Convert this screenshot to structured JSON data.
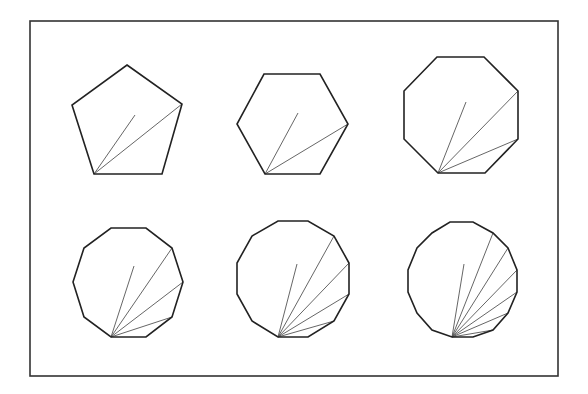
{
  "figure": {
    "frame": {
      "x": 30,
      "y": 21,
      "width": 528,
      "height": 355
    },
    "stroke_color": "#222222",
    "diagonal_color": "#555555",
    "polygons": [
      {
        "name": "pentagon",
        "sides": 5,
        "vertices": [
          [
            127,
            65
          ],
          [
            182,
            104
          ],
          [
            162,
            174
          ],
          [
            94,
            174
          ],
          [
            72,
            105
          ]
        ],
        "apex": [
          94,
          174
        ],
        "lines": [
          [
            135,
            115
          ],
          [
            182,
            104
          ]
        ]
      },
      {
        "name": "hexagon",
        "sides": 6,
        "vertices": [
          [
            264,
            74
          ],
          [
            320,
            74
          ],
          [
            348,
            124
          ],
          [
            320,
            174
          ],
          [
            265,
            174
          ],
          [
            237,
            124
          ]
        ],
        "apex": [
          265,
          174
        ],
        "lines": [
          [
            298,
            113
          ],
          [
            348,
            124
          ]
        ]
      },
      {
        "name": "octagon",
        "sides": 8,
        "vertices": [
          [
            437,
            57
          ],
          [
            484,
            57
          ],
          [
            518,
            91
          ],
          [
            518,
            139
          ],
          [
            485,
            173
          ],
          [
            438,
            173
          ],
          [
            404,
            139
          ],
          [
            404,
            91
          ]
        ],
        "apex": [
          438,
          173
        ],
        "lines": [
          [
            466,
            102
          ],
          [
            518,
            91
          ],
          [
            518,
            139
          ]
        ]
      },
      {
        "name": "decagon",
        "sides": 10,
        "vertices": [
          [
            111,
            228
          ],
          [
            146,
            228
          ],
          [
            172,
            248
          ],
          [
            183,
            282
          ],
          [
            172,
            317
          ],
          [
            146,
            337
          ],
          [
            111,
            337
          ],
          [
            84,
            317
          ],
          [
            73,
            282
          ],
          [
            84,
            248
          ]
        ],
        "apex": [
          111,
          337
        ],
        "lines": [
          [
            134,
            266
          ],
          [
            172,
            248
          ],
          [
            183,
            282
          ],
          [
            172,
            317
          ]
        ]
      },
      {
        "name": "dodecagon",
        "sides": 12,
        "vertices": [
          [
            278,
            221
          ],
          [
            308,
            221
          ],
          [
            334,
            236
          ],
          [
            349,
            263
          ],
          [
            349,
            294
          ],
          [
            334,
            321
          ],
          [
            308,
            337
          ],
          [
            278,
            337
          ],
          [
            252,
            321
          ],
          [
            237,
            294
          ],
          [
            237,
            263
          ],
          [
            252,
            236
          ]
        ],
        "apex": [
          278,
          337
        ],
        "lines": [
          [
            297,
            264
          ],
          [
            334,
            236
          ],
          [
            349,
            263
          ],
          [
            349,
            294
          ],
          [
            334,
            321
          ]
        ]
      },
      {
        "name": "tetradecagon",
        "sides": 14,
        "vertices": [
          [
            450,
            222
          ],
          [
            473,
            222
          ],
          [
            493,
            233
          ],
          [
            508,
            248
          ],
          [
            517,
            270
          ],
          [
            517,
            292
          ],
          [
            508,
            313
          ],
          [
            493,
            330
          ],
          [
            473,
            337
          ],
          [
            452,
            337
          ],
          [
            432,
            330
          ],
          [
            417,
            313
          ],
          [
            408,
            292
          ],
          [
            408,
            270
          ],
          [
            417,
            248
          ],
          [
            432,
            233
          ]
        ],
        "apex": [
          452,
          337
        ],
        "lines": [
          [
            464,
            264
          ],
          [
            493,
            233
          ],
          [
            508,
            248
          ],
          [
            517,
            270
          ],
          [
            517,
            292
          ],
          [
            508,
            313
          ],
          [
            493,
            330
          ]
        ]
      }
    ]
  }
}
